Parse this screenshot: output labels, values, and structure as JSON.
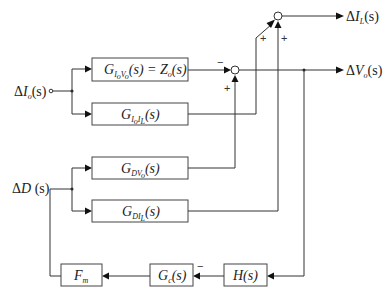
{
  "diagram": {
    "type": "control-block-diagram",
    "inputs": {
      "io": {
        "delta": "Δ",
        "var": "I",
        "sub": "o",
        "arg": "(s)"
      },
      "d": {
        "delta": "Δ",
        "var": "D",
        "arg": " (s)"
      }
    },
    "outputs": {
      "il": {
        "delta": "Δ",
        "var": "I",
        "sub": "L",
        "arg": "(s)"
      },
      "vo": {
        "delta": "Δ",
        "var": "V",
        "sub": "o",
        "arg": "(s)"
      }
    },
    "blocks": {
      "g_iovo": {
        "G": "G",
        "sub": "I",
        "subsub1": "o",
        "sub2": "V",
        "subsub2": "o",
        "arg": "(s)",
        "eq": " = Z",
        "eq_sub": "o",
        "eq_arg": "(s)"
      },
      "g_ioil": {
        "G": "G",
        "sub": "I",
        "subsub1": "o",
        "sub2": "I",
        "subsub2": "L",
        "arg": "(s)"
      },
      "g_dvo": {
        "G": "G",
        "sub": "DV",
        "subsub": "o",
        "arg": "(s)"
      },
      "g_dil": {
        "G": "G",
        "sub": "DI",
        "subsub": "L",
        "arg": "(s)"
      },
      "fm": {
        "F": "F",
        "sub": "m"
      },
      "gc": {
        "G": "G",
        "sub": "c",
        "arg": "(s)"
      },
      "h": {
        "label": "H(s)"
      }
    },
    "signs": {
      "vo_sum_top": "−",
      "vo_sum_bottom": "+",
      "il_sum_left": "+",
      "il_sum_bottom": "+",
      "gc_input": "−"
    }
  }
}
